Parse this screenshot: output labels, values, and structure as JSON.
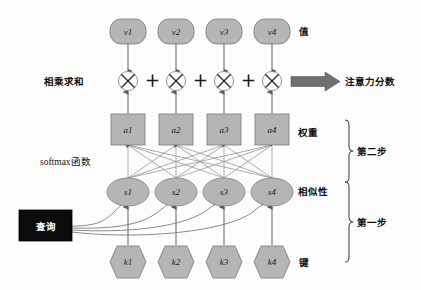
{
  "diagram": {
    "colors": {
      "node_fill": "#b5b5b5",
      "node_stroke": "#7a7a7a",
      "edge": "#7d7d7d",
      "query_fill": "#0b0b0b",
      "query_text": "#ffffff",
      "arrow_fill": "#6f6f6f",
      "text": "#111111",
      "background": "#fdfdfd"
    },
    "rows": {
      "values": {
        "row_name": "value-row",
        "shape": "rounded-rect",
        "side_label": "值",
        "nodes": [
          {
            "label": "v1"
          },
          {
            "label": "v2"
          },
          {
            "label": "v3"
          },
          {
            "label": "v4"
          }
        ]
      },
      "multiply": {
        "row_name": "multiply-row",
        "shape": "circle-cross",
        "side_label": "相乘求和",
        "operator": "⊗",
        "separator": "＋",
        "nodes": [
          {
            "label": "⊗"
          },
          {
            "label": "⊗"
          },
          {
            "label": "⊗"
          },
          {
            "label": "⊗"
          }
        ]
      },
      "weights": {
        "row_name": "weight-row",
        "shape": "square",
        "side_label": "权重",
        "nodes": [
          {
            "label": "a1"
          },
          {
            "label": "a2"
          },
          {
            "label": "a3"
          },
          {
            "label": "a4"
          }
        ]
      },
      "similarity": {
        "row_name": "similarity-row",
        "shape": "ellipse",
        "side_label": "相似性",
        "nodes": [
          {
            "label": "s1"
          },
          {
            "label": "s2"
          },
          {
            "label": "s3"
          },
          {
            "label": "s4"
          }
        ]
      },
      "keys": {
        "row_name": "key-row",
        "shape": "hexagon",
        "side_label": "键",
        "nodes": [
          {
            "label": "k1"
          },
          {
            "label": "k2"
          },
          {
            "label": "k3"
          },
          {
            "label": "k4"
          }
        ]
      }
    },
    "query_box": {
      "label": "查询"
    },
    "softmax_label": "softmax函数",
    "output_label": "注意力分数",
    "steps": [
      {
        "label": "第二步"
      },
      {
        "label": "第一步"
      }
    ]
  }
}
